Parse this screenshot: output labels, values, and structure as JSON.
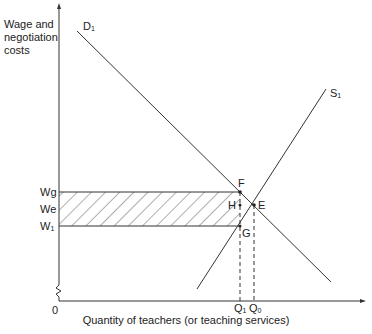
{
  "axes": {
    "y_label": "Wage and negotiation costs",
    "x_label": "Quantity of teachers (or teaching services)",
    "origin_label": "0"
  },
  "curves": {
    "demand": {
      "label": "D",
      "sub": "1"
    },
    "supply": {
      "label": "S",
      "sub": "1"
    }
  },
  "price_levels": {
    "wg": "Wg",
    "we": "We",
    "w1": {
      "label": "W",
      "sub": "1"
    }
  },
  "quantity_levels": {
    "q1": {
      "label": "Q",
      "sub": "1"
    },
    "q0": {
      "label": "Q",
      "sub": "0"
    }
  },
  "points": {
    "F": "F",
    "E": "E",
    "H": "H",
    "G": "G"
  },
  "colors": {
    "line": "#333333",
    "background": "#ffffff"
  }
}
